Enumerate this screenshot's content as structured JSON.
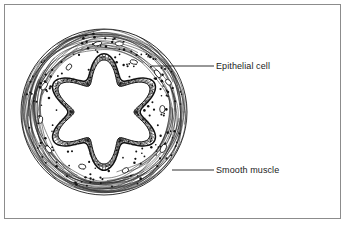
{
  "figure": {
    "background_color": "#ffffff",
    "ink_color": "#1a1a1a",
    "border_color": "#8c8c8c",
    "width": 349,
    "height": 227
  },
  "labels": [
    {
      "id": "epithelial-cell",
      "text": "Epithelial cell",
      "text_x": 216,
      "text_y": 61,
      "leader_from_x": 152,
      "leader_from_y": 66,
      "leader_to_x": 214,
      "leader_to_y": 66
    },
    {
      "id": "smooth-muscle",
      "text": "Smooth muscle",
      "text_x": 216,
      "text_y": 165,
      "leader_from_x": 172,
      "leader_from_y": 170,
      "leader_to_x": 214,
      "leader_to_y": 170
    }
  ],
  "diagram": {
    "type": "histology-cross-section",
    "center_x": 104,
    "center_y": 112,
    "outer_radius": 83,
    "muscle_inner_radius": 62,
    "epithelium_outer_radius": 58,
    "lumen_lobes": 6,
    "lumen_outer_radius": 52,
    "lumen_inner_radius": 30,
    "structures": [
      {
        "name": "smooth-muscle-layer",
        "description": "outer band of longitudinal fibre arcs with scattered nuclei"
      },
      {
        "name": "epithelial-layer",
        "description": "cobblestone cuboidal cells lining the folded lumen, with brush border"
      },
      {
        "name": "lumen",
        "description": "central six-lobed star-shaped cavity, unstained"
      }
    ]
  }
}
